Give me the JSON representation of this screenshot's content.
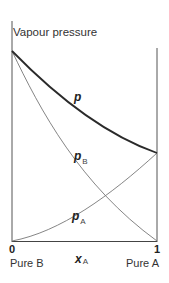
{
  "diagram": {
    "title": "Vapour pressure",
    "x_axis": {
      "variable": "x",
      "variable_sub": "A",
      "tick_left": "0",
      "tick_right": "1",
      "label_left": "Pure B",
      "label_right": "Pure A"
    },
    "curves": [
      {
        "name": "p",
        "sub": "",
        "style": "thick",
        "description": "total vapour pressure, convex curve from pure B pressure to pure A pressure"
      },
      {
        "name": "p",
        "sub": "B",
        "style": "thin",
        "description": "partial pressure of B, falls from pure B pressure to 0 at x_A = 1"
      },
      {
        "name": "p",
        "sub": "A",
        "style": "thin",
        "description": "partial pressure of A, rises from 0 at x_A = 0 to pure A pressure"
      }
    ],
    "colors": {
      "axis": "#555555",
      "total": "#2a2a2a",
      "partial": "#666666",
      "background": "#ffffff"
    }
  }
}
